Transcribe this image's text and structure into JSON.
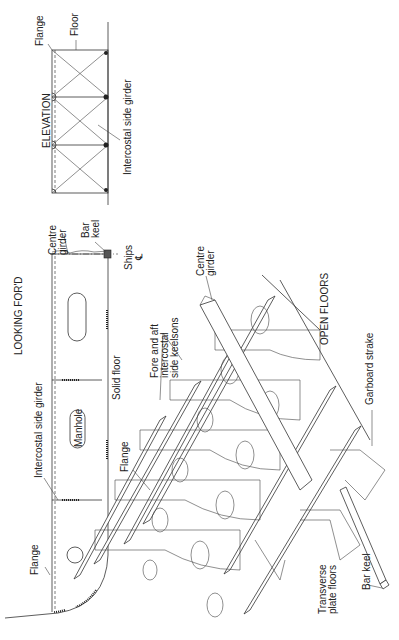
{
  "diagram": {
    "views": {
      "elevation": {
        "title": "ELEVATION",
        "labels": {
          "flange": "Flange",
          "floor": "Floor",
          "intercostal_side_girder": "Intercostal side girder"
        }
      },
      "looking_ford": {
        "title": "LOOKING FOR'D",
        "labels": {
          "centre_girder_line1": "Centre",
          "centre_girder_line2": "girder",
          "bar_keel_line1": "Bar",
          "bar_keel_line2": "keel",
          "ships_centreline_line1": "Ships",
          "ships_centreline_line2": "℄",
          "solid_floor": "Solid floor",
          "manhole": "Manhole",
          "intercostal_side_girder": "Intercostal side girder",
          "flange": "Flange"
        }
      },
      "open_floors": {
        "title": "OPEN FLOORS",
        "labels": {
          "fore_aft_line1": "Fore and aft",
          "fore_aft_line2": "intercostal",
          "fore_aft_line3": "side keelsons",
          "centre_girder_line1": "Centre",
          "centre_girder_line2": "girder",
          "garboard_strake": "Garboard strake",
          "flange": "Flange",
          "transverse_line1": "Transverse",
          "transverse_line2": "plate floors",
          "bar_keel": "Bar keel"
        }
      }
    }
  }
}
